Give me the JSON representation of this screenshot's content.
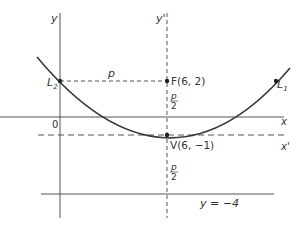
{
  "diagram": {
    "type": "parabola-geometry",
    "axes": {
      "y_label": "y",
      "y_prime_label": "y'",
      "x_label": "x",
      "x_prime_label": "x'",
      "origin_label": "0"
    },
    "points": {
      "focus": "F(6, 2)",
      "vertex": "V(6, −1)",
      "L1_main": "L",
      "L1_sub": "1",
      "L2_main": "L",
      "L2_sub": "2"
    },
    "labels": {
      "p": "p",
      "p_over_2_num_top": "p",
      "p_over_2_den_top": "2",
      "p_over_2_num_bottom": "p",
      "p_over_2_den_bottom": "2",
      "directrix": "y = −4"
    },
    "colors": {
      "line": "#444444",
      "curve": "#3a3a3a",
      "text": "#333333"
    }
  }
}
